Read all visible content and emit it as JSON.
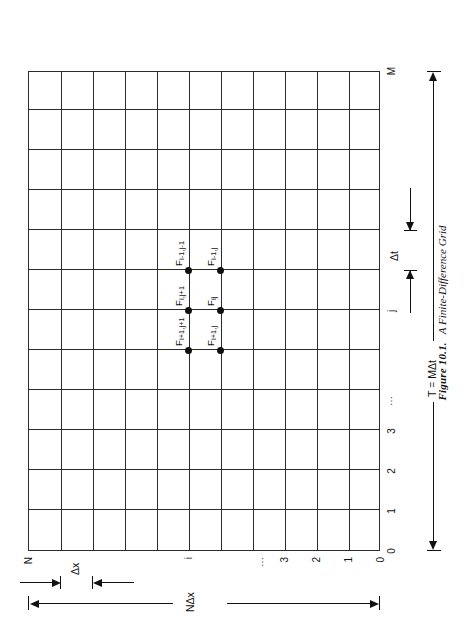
{
  "figure": {
    "caption_number": "Figure 10.1.",
    "caption_title": "A Finite-Difference Grid",
    "grid": {
      "columns": 12,
      "rows": 11
    },
    "x_axis": {
      "name": "time-axis",
      "tick_labels": [
        "0",
        "1",
        "2",
        "3",
        "⋯",
        "j",
        "M"
      ],
      "step_label": "Δt",
      "extent_label": "T = MΔt"
    },
    "y_axis": {
      "name": "space-axis",
      "tick_labels": [
        "0",
        "1",
        "2",
        "3",
        "⋯",
        "i",
        "N"
      ],
      "step_label": "Δx",
      "extent_label": "NΔx"
    },
    "stencil": {
      "nodes": [
        {
          "id": "node-ip1-jp1",
          "base": "F",
          "sub": "i+1,j+1"
        },
        {
          "id": "node-i-jp1",
          "base": "F",
          "sub": "i,j+1"
        },
        {
          "id": "node-im1-jm1",
          "base": "F",
          "sub": "i-1,j-1"
        },
        {
          "id": "node-ip1-j",
          "base": "F",
          "sub": "i+1,j"
        },
        {
          "id": "node-i-j",
          "base": "F",
          "sub": "ij"
        },
        {
          "id": "node-im1-j",
          "base": "F",
          "sub": "i-1,j"
        }
      ]
    },
    "colors": {
      "ink": "#1a1a1a",
      "grid_line": "#2b2b2b",
      "page": "#ffffff"
    }
  }
}
